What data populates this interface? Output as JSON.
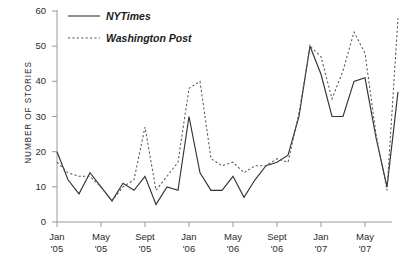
{
  "chart_data": {
    "type": "line",
    "title": "",
    "xlabel": "",
    "ylabel": "NUMBER OF STORIES",
    "ylim": [
      0,
      60
    ],
    "yticks": [
      0,
      10,
      20,
      30,
      40,
      50,
      60
    ],
    "xtick_labels": [
      {
        "month": "Jan",
        "year": "'05"
      },
      {
        "month": "May",
        "year": "'05"
      },
      {
        "month": "Sept",
        "year": "'05"
      },
      {
        "month": "Jan",
        "year": "'06"
      },
      {
        "month": "May",
        "year": "'06"
      },
      {
        "month": "Sept",
        "year": "'06"
      },
      {
        "month": "Jan",
        "year": "'07"
      },
      {
        "month": "May",
        "year": "'07"
      }
    ],
    "x": [
      "Jan '05",
      "Feb '05",
      "Mar '05",
      "Apr '05",
      "May '05",
      "Jun '05",
      "Jul '05",
      "Aug '05",
      "Sept '05",
      "Oct '05",
      "Nov '05",
      "Dec '05",
      "Jan '06",
      "Feb '06",
      "Mar '06",
      "Apr '06",
      "May '06",
      "Jun '06",
      "Jul '06",
      "Aug '06",
      "Sept '06",
      "Oct '06",
      "Nov '06",
      "Dec '06",
      "Jan '07",
      "Feb '07",
      "Mar '07",
      "Apr '07",
      "May '07",
      "Jun '07",
      "Jul '07",
      "Aug '07"
    ],
    "grid": false,
    "legend_position": "top-left",
    "series": [
      {
        "name": "NYTimes",
        "style": "solid",
        "color": "#333333",
        "values": [
          20,
          12,
          8,
          14,
          10,
          6,
          11,
          9,
          13,
          5,
          10,
          9,
          30,
          14,
          9,
          9,
          13,
          7,
          12,
          16,
          17,
          19,
          30,
          50,
          42,
          30,
          30,
          40,
          41,
          24,
          10,
          37
        ]
      },
      {
        "name": "Washington Post",
        "style": "dashed",
        "color": "#555555",
        "values": [
          17,
          14,
          13,
          13,
          10,
          6,
          10,
          12,
          27,
          9,
          13,
          17,
          38,
          40,
          18,
          16,
          17,
          14,
          16,
          16,
          18,
          17,
          31,
          50,
          47,
          35,
          43,
          54,
          48,
          25,
          9,
          58
        ]
      }
    ]
  },
  "legend": {
    "items": [
      {
        "label": "NYTimes",
        "style": "solid"
      },
      {
        "label": "Washington Post",
        "style": "dashed"
      }
    ]
  }
}
